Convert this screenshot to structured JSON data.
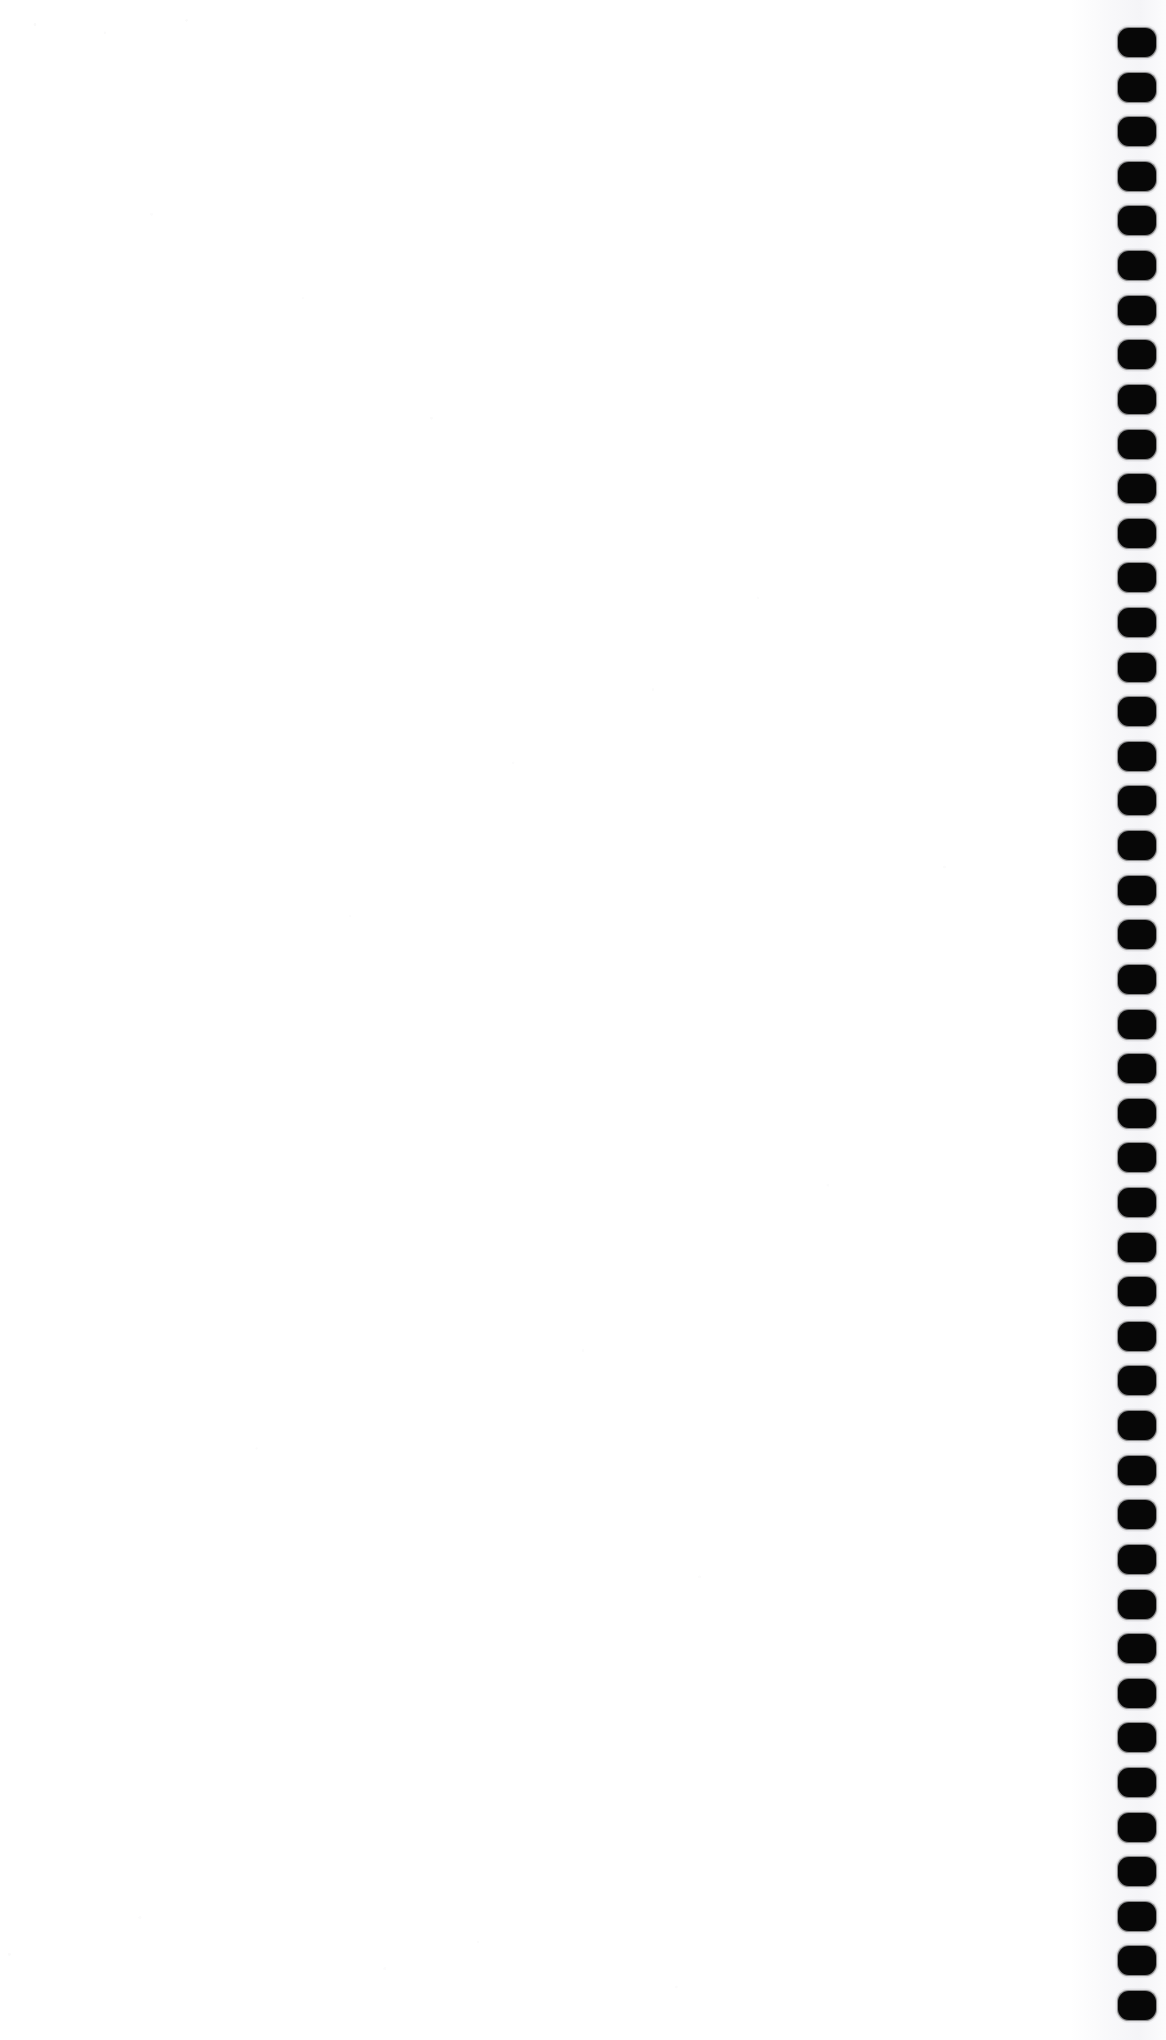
{
  "document": {
    "kind": "scanned-page",
    "title": "Blank notebook page",
    "page_width": 1166,
    "page_height": 2040,
    "background_color": "#ffffff",
    "body_text": "",
    "has_visible_text": false,
    "has_visible_figures": false,
    "notes": "Blank white scanned sheet; only feature is the column of binding punch holes along the right margin."
  },
  "binding": {
    "name": "spiral-binding-punch-holes",
    "edge": "right",
    "hole_color": "#070707",
    "hole_shape": "rounded-rectangle",
    "hole_width": 38,
    "hole_height": 29,
    "hole_corner_radius": 11,
    "hole_left_x": 1118,
    "first_hole_top_y": 28,
    "pitch": 44.6,
    "hole_count": 45,
    "holes": [
      {
        "index": 1,
        "x": 1118,
        "y": 28
      },
      {
        "index": 2,
        "x": 1118,
        "y": 73
      },
      {
        "index": 3,
        "x": 1118,
        "y": 117
      },
      {
        "index": 4,
        "x": 1118,
        "y": 162
      },
      {
        "index": 5,
        "x": 1118,
        "y": 206
      },
      {
        "index": 6,
        "x": 1118,
        "y": 251
      },
      {
        "index": 7,
        "x": 1118,
        "y": 296
      },
      {
        "index": 8,
        "x": 1118,
        "y": 340
      },
      {
        "index": 9,
        "x": 1118,
        "y": 385
      },
      {
        "index": 10,
        "x": 1118,
        "y": 430
      },
      {
        "index": 11,
        "x": 1118,
        "y": 474
      },
      {
        "index": 12,
        "x": 1118,
        "y": 519
      },
      {
        "index": 13,
        "x": 1118,
        "y": 563
      },
      {
        "index": 14,
        "x": 1118,
        "y": 608
      },
      {
        "index": 15,
        "x": 1118,
        "y": 653
      },
      {
        "index": 16,
        "x": 1118,
        "y": 697
      },
      {
        "index": 17,
        "x": 1118,
        "y": 742
      },
      {
        "index": 18,
        "x": 1118,
        "y": 786
      },
      {
        "index": 19,
        "x": 1118,
        "y": 831
      },
      {
        "index": 20,
        "x": 1118,
        "y": 876
      },
      {
        "index": 21,
        "x": 1118,
        "y": 920
      },
      {
        "index": 22,
        "x": 1118,
        "y": 965
      },
      {
        "index": 23,
        "x": 1118,
        "y": 1010
      },
      {
        "index": 24,
        "x": 1118,
        "y": 1054
      },
      {
        "index": 25,
        "x": 1118,
        "y": 1099
      },
      {
        "index": 26,
        "x": 1118,
        "y": 1143
      },
      {
        "index": 27,
        "x": 1118,
        "y": 1188
      },
      {
        "index": 28,
        "x": 1118,
        "y": 1233
      },
      {
        "index": 29,
        "x": 1118,
        "y": 1277
      },
      {
        "index": 30,
        "x": 1118,
        "y": 1322
      },
      {
        "index": 31,
        "x": 1118,
        "y": 1366
      },
      {
        "index": 32,
        "x": 1118,
        "y": 1411
      },
      {
        "index": 33,
        "x": 1118,
        "y": 1456
      },
      {
        "index": 34,
        "x": 1118,
        "y": 1500
      },
      {
        "index": 35,
        "x": 1118,
        "y": 1545
      },
      {
        "index": 36,
        "x": 1118,
        "y": 1590
      },
      {
        "index": 37,
        "x": 1118,
        "y": 1634
      },
      {
        "index": 38,
        "x": 1118,
        "y": 1679
      },
      {
        "index": 39,
        "x": 1118,
        "y": 1723
      },
      {
        "index": 40,
        "x": 1118,
        "y": 1768
      },
      {
        "index": 41,
        "x": 1118,
        "y": 1813
      },
      {
        "index": 42,
        "x": 1118,
        "y": 1857
      },
      {
        "index": 43,
        "x": 1118,
        "y": 1902
      },
      {
        "index": 44,
        "x": 1118,
        "y": 1946
      },
      {
        "index": 45,
        "x": 1118,
        "y": 1991
      }
    ]
  }
}
